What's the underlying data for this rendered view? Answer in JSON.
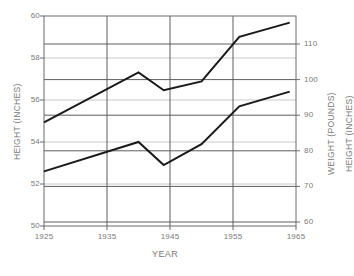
{
  "chart_data": {
    "type": "line",
    "title": "",
    "xlabel": "YEAR",
    "ylabel": "HEIGHT (INCHES)",
    "y2label": "WEIGHT (POUNDS)",
    "y3label": "HEIGHT (INCHES)",
    "xlim": [
      1925,
      1965
    ],
    "ylim": [
      50,
      60
    ],
    "y2lim": [
      60,
      115
    ],
    "grid": true,
    "legend": "none",
    "x_ticks": [
      "1925",
      "1935",
      "1945",
      "1955",
      "1965"
    ],
    "x_tick_values": [
      1925,
      1935,
      1945,
      1955,
      1965
    ],
    "y_left_ticks": [
      "60",
      "58",
      "56",
      "54",
      "52",
      "50"
    ],
    "y_left_tick_values": [
      60,
      58,
      56,
      54,
      52,
      50
    ],
    "y_right_ticks": [
      "110",
      "100",
      "90",
      "80",
      "70",
      "60"
    ],
    "y_right_tick_values": [
      110,
      100,
      90,
      80,
      70,
      60
    ],
    "series": [
      {
        "name": "WEIGHT (POUNDS)",
        "axis": "right",
        "color": "#1a1a1a",
        "x": [
          1925,
          1940,
          1944,
          1950,
          1956,
          1964
        ],
        "values": [
          88,
          102,
          97,
          99.5,
          112,
          116
        ]
      },
      {
        "name": "HEIGHT (INCHES)",
        "axis": "left",
        "color": "#1a1a1a",
        "x": [
          1925,
          1940,
          1944,
          1950,
          1956,
          1964
        ],
        "values": [
          52.6,
          54.0,
          52.9,
          53.9,
          55.7,
          56.4
        ]
      }
    ]
  },
  "axes": {
    "x_title": "YEAR",
    "left_title": "HEIGHT (INCHES)",
    "right_title_weight": "WEIGHT (POUNDS)",
    "right_title_height": "HEIGHT (INCHES)"
  },
  "colors": {
    "line": "#1a1a1a",
    "grid_major": "#5d5d5d",
    "grid_minor": "#c9c9c9",
    "frame": "#6b6b6b",
    "text": "#7a7a7a"
  }
}
